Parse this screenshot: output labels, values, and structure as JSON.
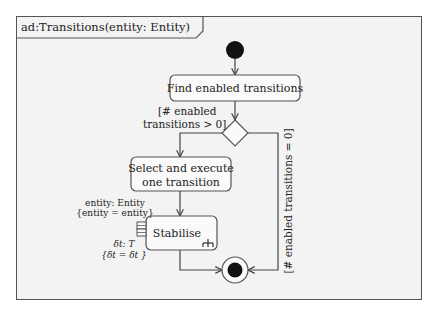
{
  "diagram": {
    "type": "uml-activity-diagram",
    "frame_title": "ad:Transitions(entity: Entity)",
    "nodes": {
      "initial": {
        "kind": "initial-node"
      },
      "find": {
        "kind": "action",
        "label": "Find enabled transitions"
      },
      "decision": {
        "kind": "decision-node"
      },
      "select": {
        "kind": "action",
        "label_line1": "Select and execute",
        "label_line2": "one transition"
      },
      "stabilise": {
        "kind": "call-behavior-action",
        "label": "Stabilise"
      },
      "final": {
        "kind": "activity-final-node"
      }
    },
    "pins": {
      "entity": {
        "line1": "entity: Entity",
        "line2": "{entity = entity}"
      },
      "delta": {
        "line1": "δt: T",
        "line2": "{δt = δt }"
      }
    },
    "guards": {
      "gt_zero_line1": "[# enabled",
      "gt_zero_line2": "transitions > 0]",
      "eq_zero": "[# enabled transitions = 0]"
    },
    "edges": [
      {
        "from": "initial",
        "to": "find"
      },
      {
        "from": "find",
        "to": "decision"
      },
      {
        "from": "decision",
        "to": "select",
        "guard": "[# enabled transitions > 0]"
      },
      {
        "from": "decision",
        "to": "final",
        "guard": "[# enabled transitions = 0]"
      },
      {
        "from": "select",
        "to": "stabilise"
      },
      {
        "from": "stabilise",
        "to": "final"
      }
    ]
  }
}
